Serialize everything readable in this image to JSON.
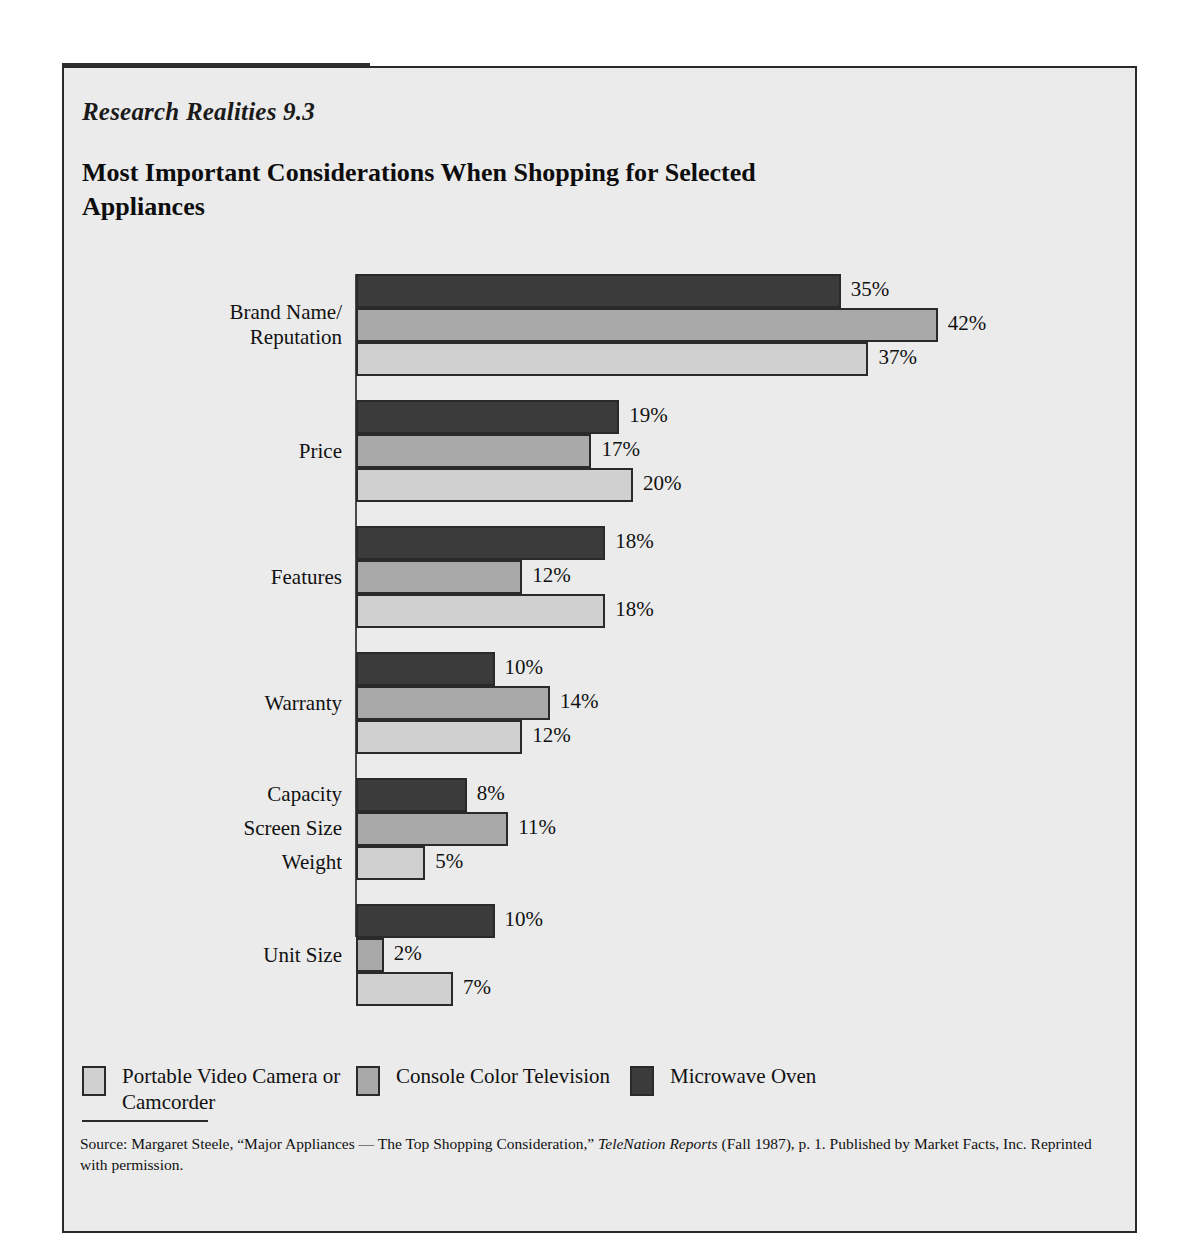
{
  "exhibit": {
    "number": "Research Realities 9.3",
    "title": "Most Important Considerations When Shopping for Selected Appliances"
  },
  "source": {
    "prefix": "Source: Margaret Steele, “Major Appliances — The Top Shopping Consideration,” ",
    "italic": "TeleNation Reports",
    "suffix": " (Fall 1987), p. 1. Published by Market Facts, Inc. Reprinted with permission."
  },
  "legend": [
    {
      "label": "Portable Video Camera or Camcorder",
      "swatch": "s-light",
      "color": "#d0d0d0"
    },
    {
      "label": "Console Color Television",
      "swatch": "s-mid",
      "color": "#a9a9a9"
    },
    {
      "label": "Microwave Oven",
      "swatch": "s-dark",
      "color": "#3b3b3b"
    }
  ],
  "chart_data": {
    "type": "bar",
    "orientation": "horizontal",
    "title": "Most Important Considerations When Shopping for Selected Appliances",
    "xlabel": "",
    "ylabel": "",
    "xlim": [
      0,
      42
    ],
    "grid": false,
    "legend_position": "bottom",
    "value_suffix": "%",
    "categories": [
      "Brand Name/ Reputation",
      "Price",
      "Features",
      "Warranty",
      "Capacity / Screen Size / Weight",
      "Unit Size"
    ],
    "series": [
      {
        "name": "Microwave Oven",
        "color": "#3b3b3b",
        "values": [
          35,
          19,
          18,
          10,
          8,
          10
        ]
      },
      {
        "name": "Console Color Television",
        "color": "#a9a9a9",
        "values": [
          42,
          17,
          12,
          14,
          11,
          2
        ]
      },
      {
        "name": "Portable Video Camera or Camcorder",
        "color": "#d0d0d0",
        "values": [
          37,
          20,
          18,
          12,
          5,
          7
        ]
      }
    ],
    "groups": [
      {
        "labels": [
          "Brand Name/",
          "Reputation"
        ],
        "label_align": "middle",
        "bars": [
          {
            "series": "Microwave Oven",
            "swatch": "s-dark",
            "value": 35,
            "value_label": "35%"
          },
          {
            "series": "Console Color Television",
            "swatch": "s-mid",
            "value": 42,
            "value_label": "42%"
          },
          {
            "series": "Portable Video Camera or Camcorder",
            "swatch": "s-light",
            "value": 37,
            "value_label": "37%"
          }
        ]
      },
      {
        "labels": [
          "Price"
        ],
        "label_align": "middle",
        "bars": [
          {
            "series": "Microwave Oven",
            "swatch": "s-dark",
            "value": 19,
            "value_label": "19%"
          },
          {
            "series": "Console Color Television",
            "swatch": "s-mid",
            "value": 17,
            "value_label": "17%"
          },
          {
            "series": "Portable Video Camera or Camcorder",
            "swatch": "s-light",
            "value": 20,
            "value_label": "20%"
          }
        ]
      },
      {
        "labels": [
          "Features"
        ],
        "label_align": "middle",
        "bars": [
          {
            "series": "Microwave Oven",
            "swatch": "s-dark",
            "value": 18,
            "value_label": "18%"
          },
          {
            "series": "Console Color Television",
            "swatch": "s-mid",
            "value": 12,
            "value_label": "12%"
          },
          {
            "series": "Portable Video Camera or Camcorder",
            "swatch": "s-light",
            "value": 18,
            "value_label": "18%"
          }
        ]
      },
      {
        "labels": [
          "Warranty"
        ],
        "label_align": "middle",
        "bars": [
          {
            "series": "Microwave Oven",
            "swatch": "s-dark",
            "value": 10,
            "value_label": "10%"
          },
          {
            "series": "Console Color Television",
            "swatch": "s-mid",
            "value": 14,
            "value_label": "14%"
          },
          {
            "series": "Portable Video Camera or Camcorder",
            "swatch": "s-light",
            "value": 12,
            "value_label": "12%"
          }
        ]
      },
      {
        "labels": [
          "Capacity",
          "Screen Size",
          "Weight"
        ],
        "label_align": "per-bar",
        "bars": [
          {
            "series": "Microwave Oven",
            "swatch": "s-dark",
            "value": 8,
            "value_label": "8%"
          },
          {
            "series": "Console Color Television",
            "swatch": "s-mid",
            "value": 11,
            "value_label": "11%"
          },
          {
            "series": "Portable Video Camera or Camcorder",
            "swatch": "s-light",
            "value": 5,
            "value_label": "5%"
          }
        ]
      },
      {
        "labels": [
          "Unit Size"
        ],
        "label_align": "middle",
        "bars": [
          {
            "series": "Microwave Oven",
            "swatch": "s-dark",
            "value": 10,
            "value_label": "10%"
          },
          {
            "series": "Console Color Television",
            "swatch": "s-mid",
            "value": 2,
            "value_label": "2%"
          },
          {
            "series": "Portable Video Camera or Camcorder",
            "swatch": "s-light",
            "value": 7,
            "value_label": "7%"
          }
        ]
      }
    ]
  }
}
